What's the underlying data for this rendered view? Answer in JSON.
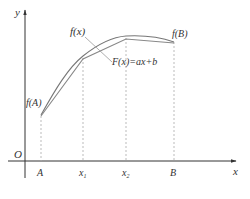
{
  "diagram": {
    "axes": {
      "y_label": "y",
      "x_label": "x",
      "origin_label": "O"
    },
    "x_ticks": [
      {
        "label": "A",
        "sub": ""
      },
      {
        "label": "x",
        "sub": "1"
      },
      {
        "label": "x",
        "sub": "2"
      },
      {
        "label": "B",
        "sub": ""
      }
    ],
    "labels": {
      "curve": "f(x)",
      "secant": "F(x)=ax+b",
      "f_at_A": "f(A)",
      "f_at_B": "f(B)"
    },
    "colors": {
      "axis": "#333333",
      "curve": "#777777",
      "guide": "#aaaaaa",
      "text": "#333333"
    }
  }
}
